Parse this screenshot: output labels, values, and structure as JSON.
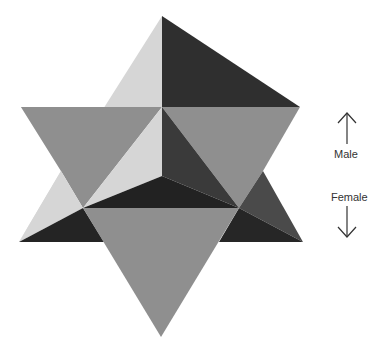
{
  "figure": {
    "title": "",
    "colors": {
      "background": "#ffffff",
      "light": "#d6d6d6",
      "mid": "#8f8f8f",
      "dark": "#2b2b2b",
      "darker": "#1f1f1f",
      "mid_dark": "#4a4a4a",
      "text": "#333333"
    }
  },
  "legend": {
    "up": {
      "label": "Male",
      "icon": "arrow-up-icon"
    },
    "down": {
      "label": "Female",
      "icon": "arrow-down-icon"
    }
  }
}
